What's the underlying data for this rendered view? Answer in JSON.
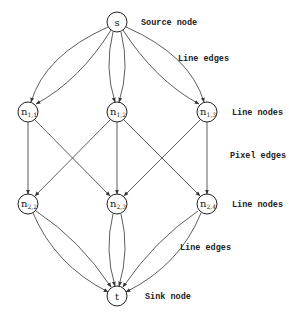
{
  "diagram": {
    "nodes": {
      "s": {
        "label": "s"
      },
      "n11": {
        "label": "n",
        "sub": "1,1"
      },
      "n12": {
        "label": "n",
        "sub": "1,2"
      },
      "n13": {
        "label": "n",
        "sub": "1,3"
      },
      "n22": {
        "label": "n",
        "sub": "2,2"
      },
      "n23": {
        "label": "n",
        "sub": "2,3"
      },
      "n24": {
        "label": "n",
        "sub": "2,4"
      },
      "t": {
        "label": "t"
      }
    },
    "edges": [
      {
        "from": "s",
        "to": "n11",
        "type": "line edge"
      },
      {
        "from": "s",
        "to": "n11",
        "type": "line edge"
      },
      {
        "from": "s",
        "to": "n12",
        "type": "line edge"
      },
      {
        "from": "s",
        "to": "n12",
        "type": "line edge"
      },
      {
        "from": "s",
        "to": "n13",
        "type": "line edge"
      },
      {
        "from": "s",
        "to": "n13",
        "type": "line edge"
      },
      {
        "from": "n11",
        "to": "n22",
        "type": "pixel edge"
      },
      {
        "from": "n11",
        "to": "n23",
        "type": "pixel edge"
      },
      {
        "from": "n12",
        "to": "n22",
        "type": "pixel edge"
      },
      {
        "from": "n12",
        "to": "n23",
        "type": "pixel edge"
      },
      {
        "from": "n12",
        "to": "n24",
        "type": "pixel edge"
      },
      {
        "from": "n13",
        "to": "n23",
        "type": "pixel edge"
      },
      {
        "from": "n13",
        "to": "n24",
        "type": "pixel edge"
      },
      {
        "from": "n22",
        "to": "t",
        "type": "line edge"
      },
      {
        "from": "n22",
        "to": "t",
        "type": "line edge"
      },
      {
        "from": "n23",
        "to": "t",
        "type": "line edge"
      },
      {
        "from": "n23",
        "to": "t",
        "type": "line edge"
      },
      {
        "from": "n24",
        "to": "t",
        "type": "line edge"
      },
      {
        "from": "n24",
        "to": "t",
        "type": "line edge"
      }
    ],
    "annotations": {
      "source_node": "Source node",
      "line_edges_top": "Line edges",
      "line_nodes_row1": "Line nodes",
      "pixel_edges": "Pixel edges",
      "line_nodes_row2": "Line nodes",
      "line_edges_bottom": "Line edges",
      "sink_node": "Sink node"
    }
  }
}
